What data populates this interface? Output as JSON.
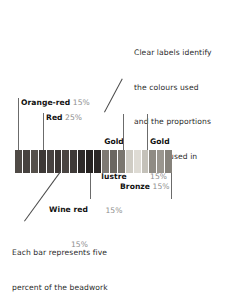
{
  "figure": {
    "bar_unit_note": "Each bar represents five percent of the beadwork"
  },
  "annotations": {
    "top_right": {
      "lines": [
        "Clear labels identify",
        "the colours used",
        "and the proportions",
        "they are used in"
      ]
    },
    "bottom_left": {
      "lines": [
        "Each bar represents five",
        "percent of the beadwork"
      ]
    }
  },
  "labels": {
    "orange_red": {
      "name": "Orange-red",
      "percent": "15%"
    },
    "red": {
      "name": "Red",
      "percent": "25%"
    },
    "gold_lustre": {
      "name_line1": "Gold",
      "name_line2": "lustre",
      "percent": "15%"
    },
    "gold": {
      "name": "Gold",
      "percent": "15%"
    },
    "wine_red": {
      "name": "Wine red",
      "percent": "15%"
    },
    "bronze": {
      "name": "Bronze",
      "percent": "15%"
    }
  },
  "chart_data": {
    "type": "bar",
    "xlabel": "",
    "ylabel": "",
    "orientation": "horizontal-stacked-strip",
    "unit_note": "Each bar represents five percent of the beadwork",
    "bar_count": 20,
    "percent_per_bar": 5,
    "categories": [
      "Orange-red",
      "Red",
      "Wine red",
      "Gold lustre",
      "Gold",
      "Bronze"
    ],
    "values": [
      15,
      25,
      15,
      15,
      15,
      15
    ],
    "colors": [
      "#4a4543",
      "#3a3230",
      "#241f1e",
      "#6f6b66",
      "#c9c6bd",
      "#8e8a83"
    ],
    "bars": [
      {
        "category": "Orange-red",
        "color": "#4f4a46"
      },
      {
        "category": "Orange-red",
        "color": "#46413e"
      },
      {
        "category": "Orange-red",
        "color": "#55504b"
      },
      {
        "category": "Red",
        "color": "#3d3836"
      },
      {
        "category": "Red",
        "color": "#474240"
      },
      {
        "category": "Red",
        "color": "#3a3533"
      },
      {
        "category": "Red",
        "color": "#4a4542"
      },
      {
        "category": "Red",
        "color": "#3f3a38"
      },
      {
        "category": "Wine red",
        "color": "#2e2a29"
      },
      {
        "category": "Wine red",
        "color": "#262221"
      },
      {
        "category": "Wine red",
        "color": "#2b2726"
      },
      {
        "category": "Gold lustre",
        "color": "#7e7a74"
      },
      {
        "category": "Gold lustre",
        "color": "#6b6761"
      },
      {
        "category": "Gold lustre",
        "color": "#7a766f"
      },
      {
        "category": "Gold",
        "color": "#cfccc4"
      },
      {
        "category": "Gold",
        "color": "#dedbd4"
      },
      {
        "category": "Gold",
        "color": "#c4c1b9"
      },
      {
        "category": "Bronze",
        "color": "#8f8b84"
      },
      {
        "category": "Bronze",
        "color": "#9a968f"
      },
      {
        "category": "Bronze",
        "color": "#86827b"
      }
    ]
  }
}
